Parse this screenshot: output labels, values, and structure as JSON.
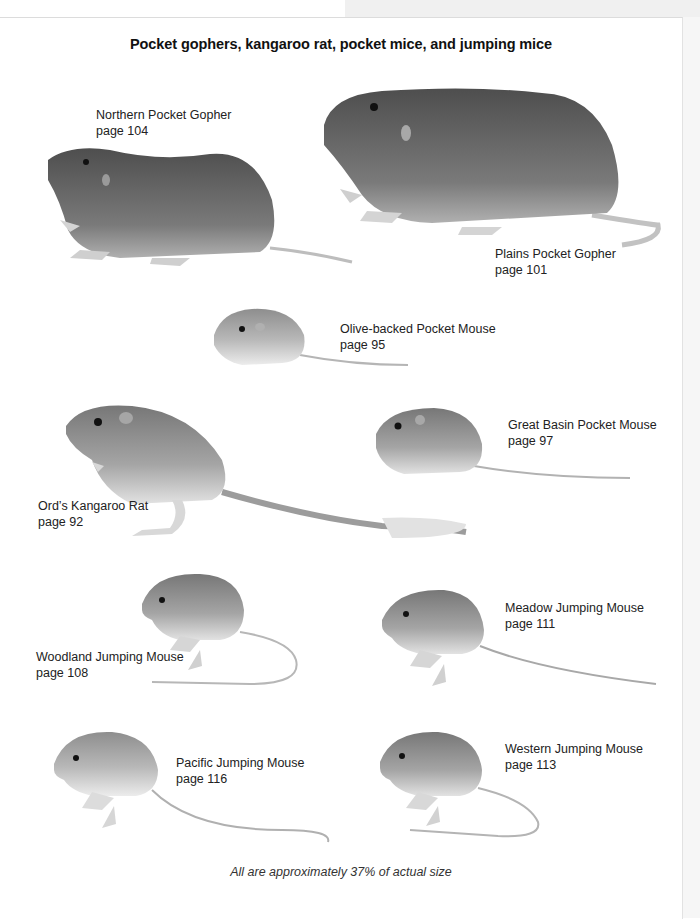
{
  "plate": {
    "title": "Pocket gophers, kangaroo rat, pocket mice, and jumping mice",
    "caption": "All are approximately 37% of actual size"
  },
  "species": [
    {
      "name": "Northern Pocket Gopher",
      "page": "page 104"
    },
    {
      "name": "Plains Pocket Gopher",
      "page": "page 101"
    },
    {
      "name": "Olive-backed Pocket Mouse",
      "page": "page 95"
    },
    {
      "name": "Ord’s Kangaroo Rat",
      "page": "page 92"
    },
    {
      "name": "Great Basin Pocket Mouse",
      "page": "page 97"
    },
    {
      "name": "Woodland Jumping Mouse",
      "page": "page 108"
    },
    {
      "name": "Meadow Jumping Mouse",
      "page": "page 111"
    },
    {
      "name": "Pacific Jumping Mouse",
      "page": "page 116"
    },
    {
      "name": "Western Jumping Mouse",
      "page": "page 113"
    }
  ],
  "colors": {
    "fur_dark": "#5a5a5a",
    "fur_mid": "#8c8c8c",
    "fur_light": "#c8c8c8",
    "belly": "#e6e6e6"
  }
}
